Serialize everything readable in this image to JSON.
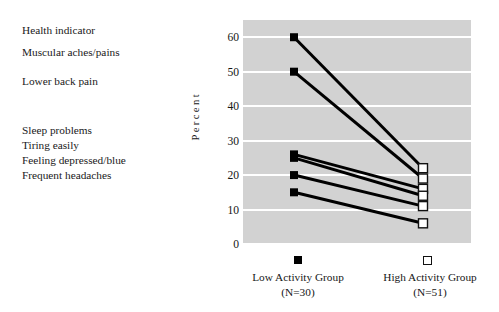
{
  "labels": {
    "items": [
      {
        "text": "Health indicator",
        "top": 0
      },
      {
        "text": "Muscular aches/pains",
        "top": 22
      },
      {
        "text": "Lower back pain",
        "top": 51
      },
      {
        "text": "Sleep problems",
        "top": 100
      },
      {
        "text": "Tiring easily",
        "top": 115
      },
      {
        "text": "Feeling depressed/blue",
        "top": 130
      },
      {
        "text": "Frequent headaches",
        "top": 145
      }
    ]
  },
  "axis": {
    "ylabel": "Percent",
    "yticks": [
      "60",
      "50",
      "40",
      "30",
      "20",
      "10",
      "0"
    ]
  },
  "legend": {
    "low_marker": "filled-square-marker",
    "high_marker": "open-square-marker"
  },
  "groups": [
    {
      "name": "Low Activity Group",
      "n": "(N=30)"
    },
    {
      "name": "High Activity Group",
      "n": "(N=51)"
    }
  ],
  "chart_data": {
    "type": "line",
    "title": "",
    "xlabel": "",
    "ylabel": "Percent",
    "ylim": [
      0,
      65
    ],
    "yticks": [
      0,
      10,
      20,
      30,
      40,
      50,
      60
    ],
    "grid": true,
    "legend_position": "below-axis",
    "categories": [
      "Low Activity Group",
      "High Activity Group"
    ],
    "category_n": [
      30,
      51
    ],
    "marker_low": "filled square",
    "marker_high": "open square",
    "series": [
      {
        "name": "Muscular aches/pains",
        "values": [
          60,
          22
        ]
      },
      {
        "name": "Lower back pain",
        "values": [
          50,
          19
        ]
      },
      {
        "name": "Sleep problems",
        "values": [
          26,
          16
        ]
      },
      {
        "name": "Tiring easily",
        "values": [
          25,
          14
        ]
      },
      {
        "name": "Feeling depressed/blue",
        "values": [
          20,
          11
        ]
      },
      {
        "name": "Frequent headaches",
        "values": [
          15,
          6
        ]
      }
    ]
  }
}
